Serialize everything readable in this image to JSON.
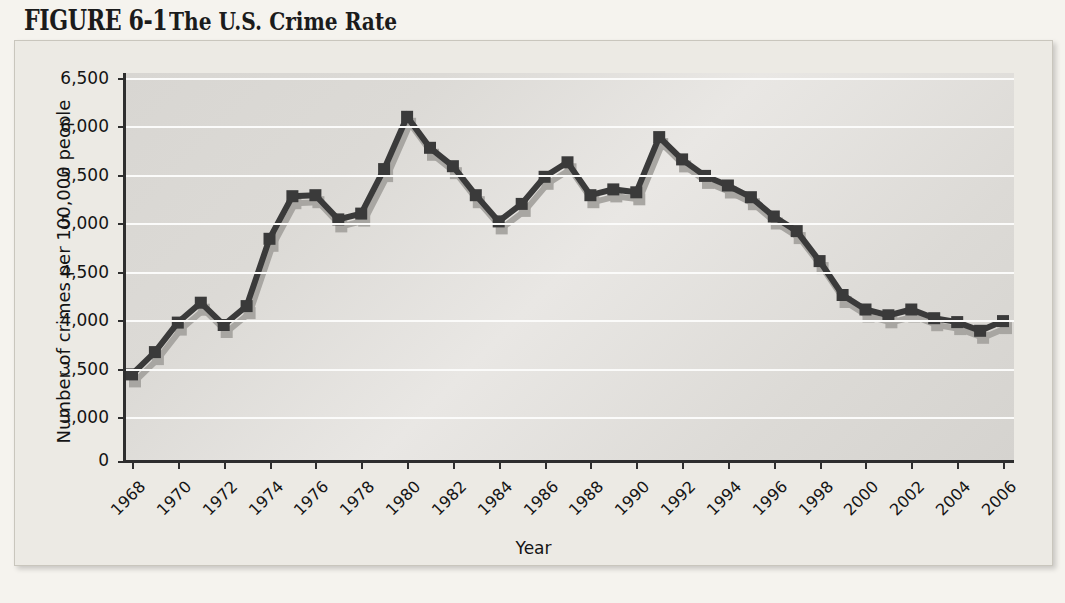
{
  "figure": {
    "label": "FIGURE 6-1",
    "title": "The U.S. Crime Rate"
  },
  "colors": {
    "line": "#3a3a3a",
    "shadow": "#a8a6a2",
    "plot_background": "#dedcd8",
    "gridline": "#fbfbfa",
    "axis": "#2e2e2e",
    "frame": "#eceae4",
    "page": "#f5f3ee",
    "text": "#141414"
  },
  "axes": {
    "y_ticks": [
      "0",
      "3,000",
      "3,500",
      "4,000",
      "4,500",
      "5,000",
      "5,500",
      "6,000",
      "6,500"
    ],
    "x_ticks": [
      "1968",
      "1970",
      "1972",
      "1974",
      "1976",
      "1978",
      "1980",
      "1982",
      "1984",
      "1986",
      "1988",
      "1990",
      "1992",
      "1994",
      "1996",
      "1998",
      "2000",
      "2002",
      "2004",
      "2006"
    ],
    "y_title": "Number of crimes per 100,000 people",
    "x_title": "Year"
  },
  "chart_data": {
    "type": "line",
    "title": "The U.S. Crime Rate",
    "xlabel": "Year",
    "ylabel": "Number of crimes per 100,000 people",
    "ylim": [
      3000,
      6500
    ],
    "ytick_values": [
      3000,
      3500,
      4000,
      4500,
      5000,
      5500,
      6000,
      6500
    ],
    "axis_break_below": 3000,
    "grid": true,
    "legend": "none",
    "marker": "square",
    "x": [
      1968,
      1969,
      1970,
      1971,
      1972,
      1973,
      1974,
      1975,
      1976,
      1977,
      1978,
      1979,
      1980,
      1981,
      1982,
      1983,
      1984,
      1985,
      1986,
      1987,
      1988,
      1989,
      1990,
      1991,
      1992,
      1993,
      1994,
      1995,
      1996,
      1997,
      1998,
      1999,
      2000,
      2001,
      2002,
      2003,
      2004,
      2005,
      2006
    ],
    "series": [
      {
        "name": "Crimes per 100,000 people",
        "values": [
          3450,
          3680,
          3985,
          4190,
          3960,
          4155,
          4850,
          5290,
          5300,
          5050,
          5110,
          5570,
          6110,
          5790,
          5600,
          5300,
          5030,
          5210,
          5490,
          5640,
          5300,
          5360,
          5330,
          5900,
          5670,
          5500,
          5400,
          5280,
          5080,
          4930,
          4620,
          4270,
          4120,
          4060,
          4120,
          4030,
          3990,
          3900,
          4000
        ]
      }
    ],
    "notable_points": [
      {
        "year": 1980,
        "value": 6110,
        "note": "peak"
      },
      {
        "year": 1991,
        "value": 5900,
        "note": "secondary peak"
      },
      {
        "year": 1968,
        "value": 3450,
        "note": "series start"
      },
      {
        "year": 2006,
        "value": 4000,
        "note": "series end"
      }
    ]
  }
}
